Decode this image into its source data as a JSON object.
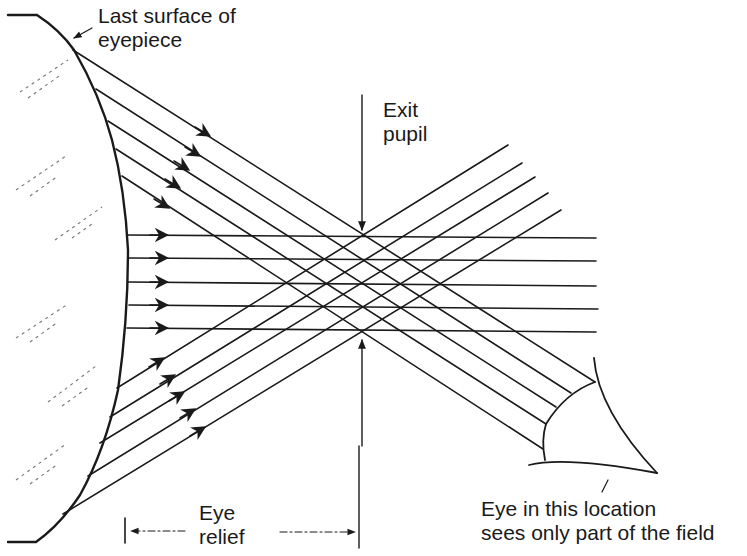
{
  "diagram": {
    "labels": {
      "last_surface_line1": "Last surface of",
      "last_surface_line2": "eyepiece",
      "exit_pupil_line1": "Exit",
      "exit_pupil_line2": "pupil",
      "eye_relief_line1": "Eye",
      "eye_relief_line2": "relief",
      "eye_location_line1": "Eye in this location",
      "eye_location_line2": "sees only part of the field"
    },
    "colors": {
      "ink": "#1a1a1a",
      "background": "#ffffff",
      "hatch": "#777777"
    },
    "ray_bundles": [
      {
        "name": "downward-rays",
        "direction": "down-right",
        "count": 5
      },
      {
        "name": "horizontal-rays",
        "direction": "right",
        "count": 5
      },
      {
        "name": "upward-rays",
        "direction": "up-right",
        "count": 5
      }
    ],
    "exit_pupil_x": 362,
    "lens_surface_x_range": [
      36,
      129
    ]
  }
}
